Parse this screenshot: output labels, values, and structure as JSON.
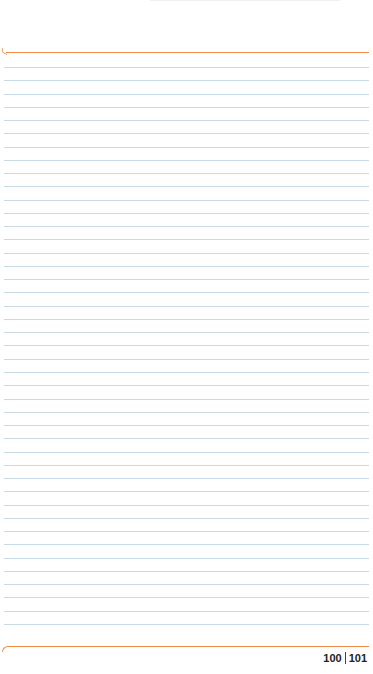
{
  "notebook": {
    "ruled_line_count": 43,
    "line_spacing_px": 13.26,
    "first_line_y": 67,
    "colors": {
      "margin_rule": "#f08a46",
      "ruled_line": "#c9dbe6",
      "paper": "#ffffff"
    },
    "page_numbers": {
      "left": "100",
      "right": "101"
    }
  }
}
